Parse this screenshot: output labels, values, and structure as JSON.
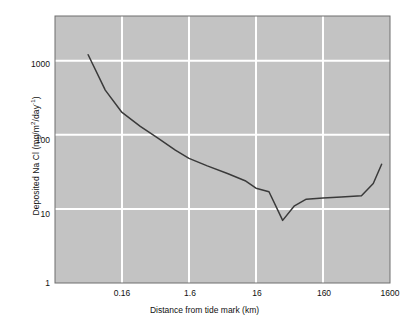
{
  "chart_data": {
    "type": "line",
    "title": "",
    "xlabel": "Distance from tide mark (km)",
    "ylabel": "Deposited Na Cl (mg/m²/day⁻¹)",
    "ylabel_parts": {
      "prefix": "Deposited Na Cl (mg/m",
      "sup1": "2",
      "mid": "/day",
      "sup2": "-1",
      "suffix": ")"
    },
    "xscale": "log",
    "yscale": "log",
    "xlim": [
      0.016,
      1600
    ],
    "ylim": [
      1,
      4000
    ],
    "grid": true,
    "legend": false,
    "xticks": [
      "0.16",
      "1.6",
      "16",
      "160",
      "1600"
    ],
    "xtick_values": [
      0.16,
      1.6,
      16,
      160,
      1600
    ],
    "yticks": [
      "1000",
      "100",
      "10",
      "1"
    ],
    "ytick_values": [
      1000,
      100,
      10,
      1
    ],
    "series": [
      {
        "name": "Deposited Na Cl",
        "color": "#3a3a3a",
        "x": [
          0.05,
          0.09,
          0.16,
          0.3,
          0.55,
          1.0,
          1.6,
          3.0,
          6.0,
          11,
          16,
          25,
          40,
          60,
          90,
          160,
          300,
          600,
          900,
          1200
        ],
        "y": [
          1200,
          400,
          200,
          130,
          90,
          62,
          48,
          38,
          30,
          24,
          19,
          17,
          7,
          11,
          13.5,
          14,
          14.5,
          15,
          22,
          40
        ]
      }
    ],
    "annotations": []
  },
  "style": {
    "plot_background": "#c3c3c3",
    "grid_color": "#ffffff",
    "axis_color": "#6e6e6e",
    "line_color": "#3a3a3a",
    "page_background": "#ffffff"
  }
}
